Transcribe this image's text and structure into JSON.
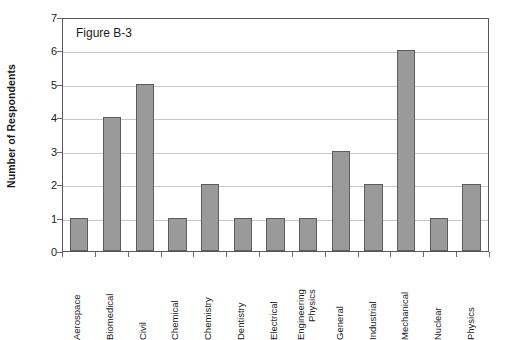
{
  "chart_data": {
    "type": "bar",
    "title": "Figure B-3",
    "xlabel": "",
    "ylabel": "Number of Respondents",
    "ylim": [
      0,
      7
    ],
    "ytick_step": 1,
    "yticks": [
      "0",
      "1",
      "2",
      "3",
      "4",
      "5",
      "6",
      "7"
    ],
    "grid": "horizontal",
    "legend": "none",
    "categories": [
      "Aerospace",
      "Biomedical",
      "Civil",
      "Chemical",
      "Chemistry",
      "Dentistry",
      "Electrical",
      "Engineering Physics",
      "General",
      "Industrial",
      "Mechanical",
      "Nuclear",
      "Physics"
    ],
    "category_lines": [
      [
        "Aerospace"
      ],
      [
        "Biomedical"
      ],
      [
        "Civil"
      ],
      [
        "Chemical"
      ],
      [
        "Chemistry"
      ],
      [
        "Dentistry"
      ],
      [
        "Electrical"
      ],
      [
        "Engineering",
        "Physics"
      ],
      [
        "General"
      ],
      [
        "Industrial"
      ],
      [
        "Mechanical"
      ],
      [
        "Nuclear"
      ],
      [
        "Physics"
      ]
    ],
    "values": [
      1,
      4,
      5,
      1,
      2,
      1,
      1,
      1,
      3,
      2,
      6,
      1,
      2
    ],
    "colors": {
      "bar_fill": "#9a9a9a",
      "bar_border": "#5c5c5c",
      "gridline": "#c9c9c9",
      "axis": "#58585a",
      "text": "#1a1a1a",
      "background": "#ffffff"
    }
  }
}
